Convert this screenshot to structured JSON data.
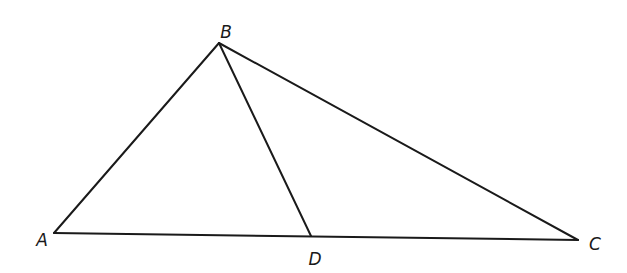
{
  "diagram": {
    "type": "triangle-with-cevian",
    "points": {
      "A": {
        "label": "A",
        "x": 54,
        "y": 233,
        "label_x": 42,
        "label_y": 246
      },
      "B": {
        "label": "B",
        "x": 219,
        "y": 43,
        "label_x": 226,
        "label_y": 38
      },
      "C": {
        "label": "C",
        "x": 578,
        "y": 240,
        "label_x": 595,
        "label_y": 250
      },
      "D": {
        "label": "D",
        "x": 311,
        "y": 236,
        "label_x": 315,
        "label_y": 265
      }
    },
    "segments": [
      {
        "name": "AB",
        "from": "A",
        "to": "B"
      },
      {
        "name": "BC",
        "from": "B",
        "to": "C"
      },
      {
        "name": "AC",
        "from": "A",
        "to": "C"
      },
      {
        "name": "BD",
        "from": "B",
        "to": "D"
      }
    ],
    "colors": {
      "stroke": "#1a1a1a",
      "background": "#ffffff"
    }
  }
}
